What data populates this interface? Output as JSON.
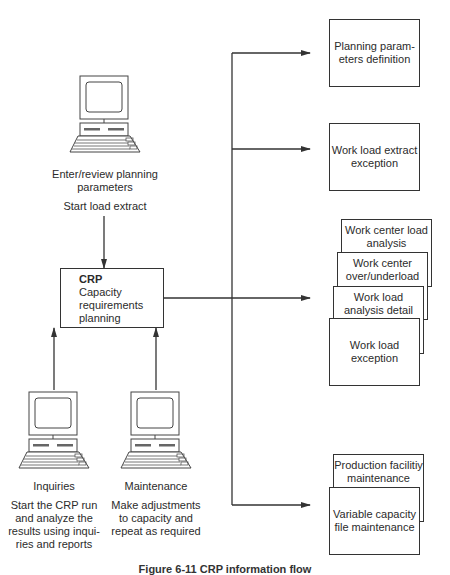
{
  "diagram": {
    "title": "CRP information flow",
    "caption": "Figure 6-11  CRP information flow",
    "top_terminal": {
      "icon": "computer-terminal-icon",
      "label": "Enter/review planning parameters",
      "label_lines": [
        "Enter/review planning",
        "parameters"
      ],
      "action": "Start load extract"
    },
    "center_process": {
      "title": "CRP",
      "lines": [
        "Capacity",
        "requirements",
        "planning"
      ]
    },
    "bottom_terminals": [
      {
        "icon": "computer-terminal-icon",
        "label": "Inquiries",
        "description_lines": [
          "Start the CRP run",
          "and analyze the",
          "results using inqui-",
          "ries and reports"
        ]
      },
      {
        "icon": "computer-terminal-icon",
        "label": "Maintenance",
        "description_lines": [
          "Make adjustments",
          "to capacity and",
          "repeat as required"
        ]
      }
    ],
    "outputs": [
      {
        "group": "planning-parameters",
        "boxes": [
          {
            "lines": [
              "Planning param-",
              "eters definition"
            ]
          }
        ]
      },
      {
        "group": "extract-exception",
        "boxes": [
          {
            "lines": [
              "Work load extract",
              "exception"
            ]
          }
        ]
      },
      {
        "group": "load-analysis-reports",
        "boxes": [
          {
            "lines": [
              "Work center load",
              "analysis"
            ]
          },
          {
            "lines": [
              "Work center",
              "over/underload"
            ]
          },
          {
            "lines": [
              "Work load",
              "analysis detail"
            ]
          },
          {
            "lines": [
              "Work load",
              "exception"
            ]
          }
        ]
      },
      {
        "group": "maintenance-reports",
        "boxes": [
          {
            "lines": [
              "Production facilitiy",
              "maintenance"
            ]
          },
          {
            "lines": [
              "Variable capacity",
              "file maintenance"
            ]
          }
        ]
      }
    ],
    "colors": {
      "line": "#333333",
      "text": "#2b2b2b",
      "background": "#ffffff"
    }
  }
}
